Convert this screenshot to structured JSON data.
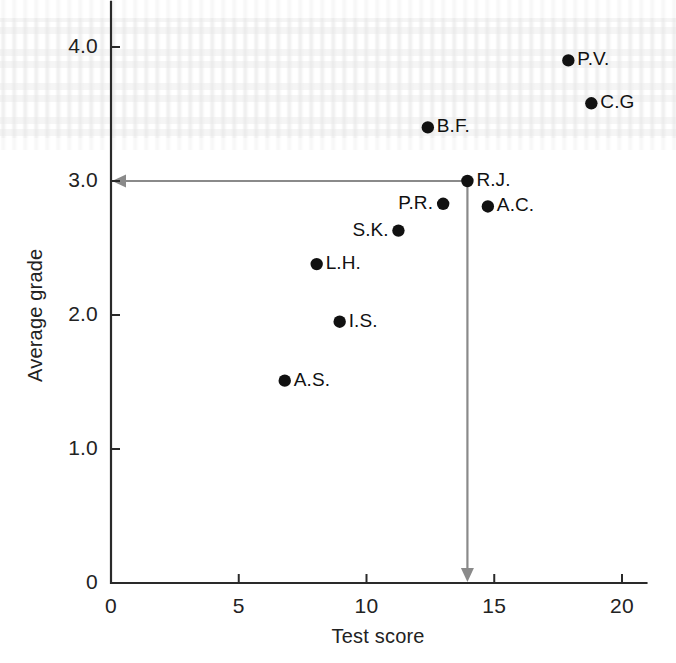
{
  "chart_data": {
    "type": "scatter",
    "title": "",
    "xlabel": "Test score",
    "ylabel": "Average grade",
    "xlim": [
      0,
      21
    ],
    "ylim": [
      0,
      4.3
    ],
    "xticks": [
      "0",
      "5",
      "10",
      "15",
      "20"
    ],
    "xtick_values": [
      0,
      5,
      10,
      15,
      20
    ],
    "yticks": [
      "0",
      "1.0",
      "2.0",
      "3.0",
      "4.0"
    ],
    "ytick_values": [
      0,
      1.0,
      2.0,
      3.0,
      4.0
    ],
    "grid": false,
    "legend": "none",
    "points": [
      {
        "label": "P.V.",
        "x": 17.9,
        "y": 3.9,
        "label_side": "right"
      },
      {
        "label": "C.G",
        "x": 18.8,
        "y": 3.58,
        "label_side": "right"
      },
      {
        "label": "B.F.",
        "x": 12.4,
        "y": 3.4,
        "label_side": "right"
      },
      {
        "label": "R.J.",
        "x": 13.95,
        "y": 3.0,
        "label_side": "right"
      },
      {
        "label": "A.C.",
        "x": 14.75,
        "y": 2.81,
        "label_side": "right"
      },
      {
        "label": "P.R.",
        "x": 13.0,
        "y": 2.83,
        "label_side": "left"
      },
      {
        "label": "S.K.",
        "x": 11.25,
        "y": 2.63,
        "label_side": "left"
      },
      {
        "label": "L.H.",
        "x": 8.05,
        "y": 2.38,
        "label_side": "right"
      },
      {
        "label": "I.S.",
        "x": 8.95,
        "y": 1.95,
        "label_side": "right"
      },
      {
        "label": "A.S.",
        "x": 6.8,
        "y": 1.51,
        "label_side": "right"
      }
    ],
    "annotations": [
      {
        "name": "horizontal-guide-arrow",
        "from": {
          "x": 13.95,
          "y": 3.0
        },
        "to": {
          "x": 0,
          "y": 3.0
        },
        "direction": "left",
        "color": "#8a8a8a",
        "describes": "R.J. average grade read off the y-axis at 3.0"
      },
      {
        "name": "vertical-guide-arrow",
        "from": {
          "x": 13.95,
          "y": 3.0
        },
        "to": {
          "x": 13.95,
          "y": 0
        },
        "direction": "down",
        "color": "#8a8a8a",
        "describes": "R.J. test score read off the x-axis at about 13.8"
      }
    ],
    "colors": {
      "point": "#111111",
      "axis": "#2a2a2a",
      "annotation": "#8a8a8a",
      "background": "#ffffff"
    }
  }
}
